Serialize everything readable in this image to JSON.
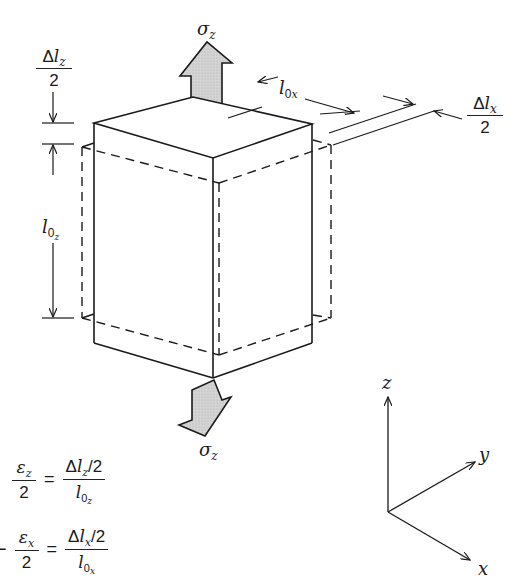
{
  "diagram": {
    "type": "tensile-strain-box",
    "colors": {
      "line": "#1a1a1a",
      "arrow_fill": "#d0d0d0"
    }
  },
  "labels": {
    "sigma_top": "σz",
    "sigma_bottom": "σz",
    "delta_lz_num": "Δlz",
    "delta_lz_den": "2",
    "l0z": "l0z",
    "l0x": "l0x",
    "delta_lx_num": "Δlx",
    "delta_lx_den": "2"
  },
  "symbols": {
    "sigma": "σ",
    "z": "z",
    "x": "x",
    "y": "y",
    "delta": "Δ",
    "l": "l",
    "zero": "0",
    "eps": "ε",
    "two": "2",
    "equals": "=",
    "minus": "−"
  },
  "equations": [
    {
      "lhs_num": "εz",
      "lhs_den": "2",
      "rhs_num": "Δlz/2",
      "rhs_den": "l0z"
    },
    {
      "sign": "−",
      "lhs_num": "εx",
      "lhs_den": "2",
      "rhs_num": "Δlx/2",
      "rhs_den": "l0x"
    }
  ],
  "axes": {
    "z_label": "z",
    "y_label": "y",
    "x_label": "x"
  }
}
